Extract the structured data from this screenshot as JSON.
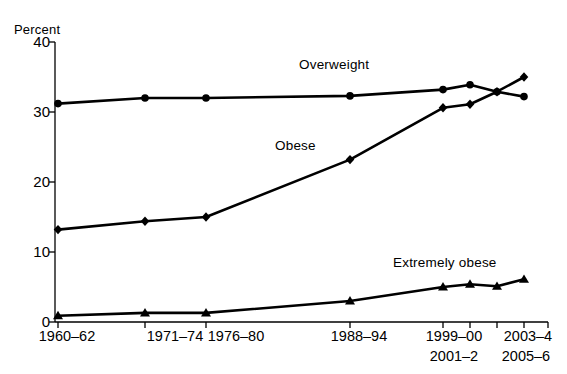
{
  "chart_data": {
    "type": "line",
    "title": "",
    "xlabel": "",
    "ylabel": "Percent",
    "ylim": [
      0,
      40
    ],
    "yticks": [
      0,
      10,
      20,
      30,
      40
    ],
    "grid": false,
    "legend_position": "inline-annotations",
    "categories": [
      "1960–62",
      "1971–74",
      "1976–80",
      "1988–94",
      "1999–00",
      "2001–2",
      "2003–4",
      "2005–6"
    ],
    "series": [
      {
        "name": "Overweight",
        "marker": "circle",
        "values": [
          31.2,
          32.0,
          32.0,
          32.3,
          33.2,
          33.9,
          32.9,
          32.2
        ]
      },
      {
        "name": "Obese",
        "marker": "diamond",
        "values": [
          13.2,
          14.4,
          15.0,
          23.2,
          30.6,
          31.1,
          32.9,
          35.0
        ]
      },
      {
        "name": "Extremely obese",
        "marker": "triangle",
        "values": [
          0.9,
          1.3,
          1.3,
          3.0,
          5.0,
          5.4,
          5.1,
          6.1
        ]
      }
    ]
  },
  "axis": {
    "y_title": "Percent",
    "ytick_labels": [
      "40",
      "30",
      "20",
      "10",
      "0"
    ],
    "xtick_row1": [
      "1960–62",
      "1971–74",
      "1976–80",
      "1988–94",
      "1999–00",
      "2003–4"
    ],
    "xtick_row2": [
      "2001–2",
      "2005–6"
    ]
  },
  "annotations": {
    "overweight": "Overweight",
    "obese": "Obese",
    "extremely_obese": "Extremely obese"
  },
  "colors": {
    "ink": "#000000",
    "background": "#ffffff"
  }
}
